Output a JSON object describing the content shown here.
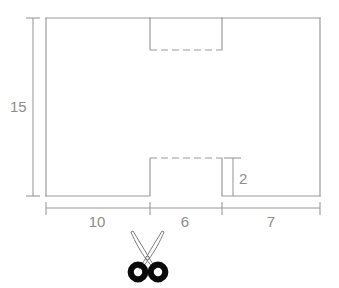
{
  "figure": {
    "type": "geometry-diagram",
    "stroke_color": "#9a9a9a",
    "text_color": "#8c8c8c",
    "scissors_color": "#0a0a0a",
    "background": "#ffffff"
  },
  "shape": {
    "name": "rectangle",
    "outline": {
      "x": 46,
      "y": 18,
      "width": 274,
      "height": 178
    },
    "notches": [
      {
        "name": "top-notch",
        "x": 150,
        "y": 18,
        "width": 72,
        "height": 32,
        "open_edge": "top",
        "cut_line_style": "dash-dot"
      },
      {
        "name": "bottom-notch",
        "x": 150,
        "y": 158,
        "width": 72,
        "height": 38,
        "open_edge": "bottom",
        "cut_line_style": "dash-dot"
      }
    ]
  },
  "dimensions": {
    "height_label": "15",
    "notch_depth_label": "2",
    "width_segments": [
      {
        "label": "10",
        "from_x": 46,
        "to_x": 150
      },
      {
        "label": "6",
        "from_x": 150,
        "to_x": 222
      },
      {
        "label": "7",
        "from_x": 222,
        "to_x": 320
      }
    ],
    "baseline_y": 208,
    "vertical_dim_x": 33,
    "depth_dim_x": 233
  },
  "annotations": {
    "scissors_icon": "scissors-icon",
    "scissors_position": {
      "x": 148,
      "y": 252
    }
  }
}
